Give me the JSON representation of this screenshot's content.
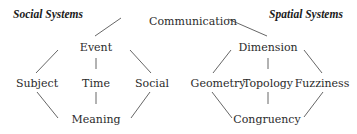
{
  "diagram": {
    "headers": {
      "left": "Social Systems",
      "right": "Spatial Systems"
    },
    "root": "Communication",
    "social": {
      "top": "Event",
      "middle": [
        "Subject",
        "Time",
        "Social"
      ],
      "bottom": "Meaning"
    },
    "spatial": {
      "top": "Dimension",
      "middle": [
        "Geometry",
        "Topology",
        "Fuzziness"
      ],
      "bottom": "Congruency"
    },
    "edges": [
      [
        "Communication",
        "Event"
      ],
      [
        "Communication",
        "Dimension"
      ],
      [
        "Event",
        "Subject"
      ],
      [
        "Event",
        "Time"
      ],
      [
        "Event",
        "Social"
      ],
      [
        "Subject",
        "Meaning"
      ],
      [
        "Time",
        "Meaning"
      ],
      [
        "Social",
        "Meaning"
      ],
      [
        "Dimension",
        "Geometry"
      ],
      [
        "Dimension",
        "Topology"
      ],
      [
        "Dimension",
        "Fuzziness"
      ],
      [
        "Geometry",
        "Congruency"
      ],
      [
        "Topology",
        "Congruency"
      ],
      [
        "Fuzziness",
        "Congruency"
      ]
    ],
    "line_color": "#555555"
  }
}
